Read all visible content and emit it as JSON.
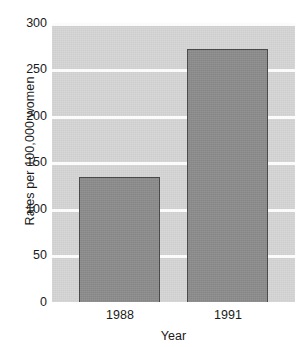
{
  "chart_data": {
    "type": "bar",
    "title": "",
    "subtitle": "",
    "xlabel": "Year",
    "ylabel": "Rates per 100,000 women",
    "categories": [
      "1988",
      "1991"
    ],
    "values": [
      134,
      272
    ],
    "series": [
      {
        "name": "Rates per 100,000 women",
        "values": [
          134,
          272
        ]
      }
    ],
    "ylim": [
      0,
      300
    ],
    "yticks": [
      0,
      50,
      100,
      150,
      200,
      250,
      300
    ],
    "ytick_labels": [
      "0",
      "50",
      "100",
      "150",
      "200",
      "250",
      "300"
    ],
    "xtick_labels": [
      "1988",
      "1991"
    ],
    "grid": true,
    "grid_axis": "y",
    "grid_color": "#fbfbfb",
    "legend": false,
    "legend_position": "none",
    "annotations": [],
    "style": {
      "panel_background": "#d6d6d6",
      "bar_fill": "#8d8d8d",
      "bar_edge": "#4a4a4a",
      "figure_background": "#ffffff",
      "text_color": "#1a1a1a"
    }
  }
}
